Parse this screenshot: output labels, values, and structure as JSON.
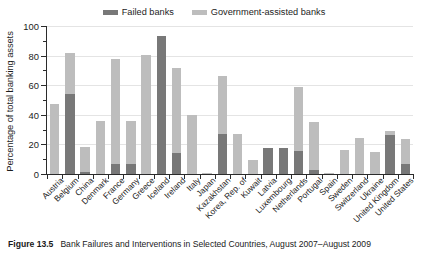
{
  "chart_data": {
    "type": "bar",
    "title": "",
    "xlabel": "",
    "ylabel": "Percentage of total banking assets",
    "ylim": [
      0,
      100
    ],
    "yticks": [
      0,
      20,
      40,
      60,
      80,
      100
    ],
    "minor_yticks": [
      10,
      30,
      50,
      70,
      90
    ],
    "grid": true,
    "stacked": true,
    "legend_position": "top-center",
    "categories": [
      "Austria",
      "Belgium",
      "China",
      "Denmark",
      "France",
      "Germany",
      "Greece",
      "Iceland",
      "Ireland",
      "Italy",
      "Japan",
      "Kazakhstan",
      "Korea, Rep. of",
      "Kuwait",
      "Latvia",
      "Luxembourg",
      "Netherlands",
      "Portugal",
      "Spain",
      "Sweden",
      "Switzerland",
      "Ukraine",
      "United Kingdom",
      "United States"
    ],
    "series": [
      {
        "name": "Failed banks",
        "color": "#787878",
        "values": [
          0,
          54,
          1.5,
          0,
          7,
          6.5,
          0,
          93,
          14.5,
          0,
          0,
          27,
          0,
          0,
          17.5,
          17.5,
          15.5,
          2.5,
          0,
          0,
          0,
          0,
          26.5,
          6.5
        ]
      },
      {
        "name": "Government-assisted banks",
        "color": "#bdbdbd",
        "values": [
          47.5,
          27.5,
          16.5,
          36,
          70.5,
          29,
          80.5,
          0,
          57,
          40,
          1,
          39,
          27,
          9.5,
          0,
          0,
          43,
          32.5,
          0.8,
          16,
          24,
          15,
          2.5,
          17
        ]
      }
    ],
    "totals": [
      47.5,
      81.5,
      18,
      36,
      77.5,
      35.5,
      80.5,
      93,
      71.5,
      40,
      1,
      66,
      27,
      9.5,
      17.5,
      17.5,
      58.5,
      35,
      0.8,
      16,
      24,
      15,
      29,
      23.5
    ]
  },
  "legend": {
    "entries": [
      {
        "label": "Failed banks",
        "color": "#787878"
      },
      {
        "label": "Government-assisted banks",
        "color": "#bdbdbd"
      }
    ]
  },
  "caption": {
    "figure_number": "Figure 13.5",
    "text": "Bank Failures and Interventions in Selected Countries, August 2007–August 2009"
  }
}
